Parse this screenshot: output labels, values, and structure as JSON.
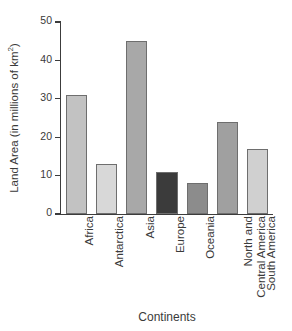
{
  "chart_data": {
    "type": "bar",
    "title": "",
    "xlabel": "Continents",
    "ylabel": "Land Area (in millions of km",
    "ylabel_sup": "2",
    "ylabel_tail": ")",
    "categories": [
      "Africa",
      "Antarctica",
      "Asia",
      "Europe",
      "Oceania",
      "North and Central America",
      "South America"
    ],
    "values": [
      31,
      13,
      45,
      11,
      8,
      24,
      17
    ],
    "colors": [
      "#c2c2c2",
      "#d8d8d8",
      "#a8a8a8",
      "#3b3b3b",
      "#8c8c8c",
      "#a0a0a0",
      "#d0d0d0"
    ],
    "ylim": [
      0,
      50
    ],
    "yticks": [
      0,
      10,
      20,
      30,
      40,
      50
    ],
    "ytick_labels": [
      "0",
      "10",
      "20",
      "30",
      "40",
      "50"
    ],
    "grid": false,
    "legend": "none",
    "axis_color": "#3c3c3c",
    "bar_edge_color": "#6e6e6e"
  },
  "xlabels_display": [
    "Africa",
    "Antarctica",
    "Asia",
    "Europe",
    "Oceania",
    "North and\nCentral America",
    "South America"
  ],
  "clipped_top_text": ""
}
